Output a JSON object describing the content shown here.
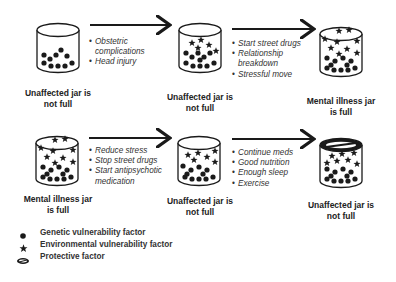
{
  "diagram": {
    "row1": {
      "jars": [
        {
          "label": "Unaffected jar is not full",
          "label_lines": [
            "Unaffected jar is",
            "not full"
          ],
          "genetic_factors": 9,
          "environmental_factors": 0,
          "protective_lid": false
        },
        {
          "label": "Unaffected jar is not full",
          "label_lines": [
            "Unaffected jar is",
            "not full"
          ],
          "genetic_factors": 11,
          "environmental_factors": 5,
          "protective_lid": false
        },
        {
          "label": "Mental illness jar is full",
          "label_lines": [
            "Mental illness jar",
            "is full"
          ],
          "genetic_factors": 11,
          "environmental_factors": 9,
          "protective_lid": false
        }
      ],
      "transitions": [
        {
          "items": [
            "Obstetric complications",
            "Head injury"
          ],
          "lines": [
            "Obstetric",
            "complications",
            "Head injury"
          ]
        },
        {
          "items": [
            "Start street drugs",
            "Relationship breakdown",
            "Stressful move"
          ]
        }
      ]
    },
    "row2": {
      "jars": [
        {
          "label": "Mental illness jar is full",
          "label_lines": [
            "Mental illness jar",
            "is full"
          ],
          "genetic_factors": 11,
          "environmental_factors": 9,
          "protective_lid": false
        },
        {
          "label": "Unaffected jar is not full",
          "label_lines": [
            "Unaffected jar is",
            "not full"
          ],
          "genetic_factors": 11,
          "environmental_factors": 5,
          "protective_lid": false
        },
        {
          "label": "Unaffected jar is not full",
          "label_lines": [
            "Unaffected jar is",
            "not full"
          ],
          "genetic_factors": 11,
          "environmental_factors": 7,
          "protective_lid": true
        }
      ],
      "transitions": [
        {
          "items": [
            "Reduce stress",
            "Stop street drugs",
            "Start antipsychotic medication"
          ]
        },
        {
          "items": [
            "Continue meds",
            "Good nutrition",
            "Enough sleep",
            "Exercise"
          ]
        }
      ]
    }
  },
  "legend": [
    {
      "icon": "dot-icon",
      "label": "Genetic vulnerability factor"
    },
    {
      "icon": "star-icon",
      "label": "Environmental vulnerability factor"
    },
    {
      "icon": "lid-icon",
      "label": "Protective factor"
    }
  ],
  "colors": {
    "ink": "#1a1a1a",
    "background": "#ffffff"
  }
}
